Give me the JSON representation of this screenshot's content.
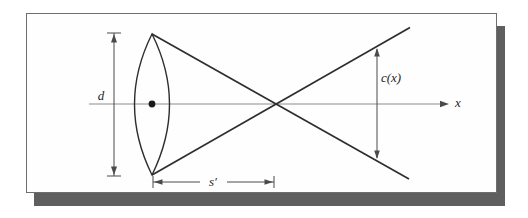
{
  "figure": {
    "type": "lens-circle-of-confusion-diagram",
    "labels": {
      "lens_diameter": "d",
      "image_distance": "s′",
      "circle_of_confusion": "c(x)",
      "axis": "x"
    },
    "colors": {
      "ray": "#2e2e2e",
      "lens": "#2e2e2e",
      "dot": "#1a1a1a",
      "dimension": "#4a4a4a",
      "axis": "#8c8c8c",
      "frame_border": "#6e6e6e",
      "shadow": "#5f5f5f",
      "background": "#ffffff"
    }
  }
}
